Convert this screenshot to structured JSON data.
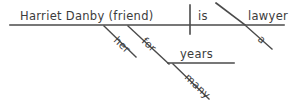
{
  "diagram": {
    "type": "reed-kellogg-sentence-diagram",
    "sentence": "Harriet Danby (friend) is a lawyer for many years.",
    "colors": {
      "background": "#ffffff",
      "line": "#4a4a4a",
      "text": "#3c3c3c"
    },
    "labels": {
      "subject": "Harriet Danby (friend)",
      "verb": "is",
      "predicate_nominative": "lawyer",
      "article": "a",
      "possessive_modifier": "her",
      "preposition": "for",
      "object_of_preposition": "years",
      "adjective_modifier": "many"
    },
    "geometry": {
      "baseline": {
        "x1": 10,
        "y1": 25,
        "x2": 284,
        "y2": 25
      },
      "subject_verb_divider": {
        "x1": 190,
        "y1": 5,
        "x2": 190,
        "y2": 34
      },
      "predicate_slant": {
        "x1": 216,
        "y1": 3,
        "x2": 245,
        "y2": 25
      },
      "article_slant": {
        "x1": 246,
        "y1": 26,
        "x2": 272,
        "y2": 49
      },
      "her_slant": {
        "x1": 104,
        "y1": 26,
        "x2": 136,
        "y2": 57
      },
      "for_slant": {
        "x1": 128,
        "y1": 26,
        "x2": 169,
        "y2": 64
      },
      "prep_object_line": {
        "x1": 168,
        "y1": 63,
        "x2": 234,
        "y2": 63
      },
      "many_slant": {
        "x1": 173,
        "y1": 64,
        "x2": 209,
        "y2": 99
      }
    },
    "text_positions": {
      "subject": {
        "x": 20,
        "y": 20
      },
      "verb": {
        "x": 198,
        "y": 20
      },
      "predicate_nominative": {
        "x": 248,
        "y": 20
      },
      "article": {
        "x": 257,
        "y": 40,
        "rotate": 41
      },
      "possessive_modifier": {
        "x": 113,
        "y": 41,
        "rotate": 44
      },
      "preposition": {
        "x": 141,
        "y": 42,
        "rotate": 43
      },
      "object_of_preposition": {
        "x": 180,
        "y": 58
      },
      "adjective_modifier": {
        "x": 184,
        "y": 78,
        "rotate": 44
      }
    }
  }
}
